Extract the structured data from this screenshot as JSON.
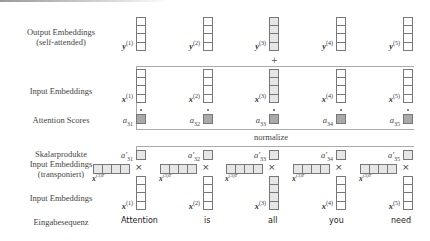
{
  "row_labels": {
    "output": "Output Embeddings",
    "output_sub": "(self-attended)",
    "input_top": "Input Embeddings",
    "scores": "Attention Scores",
    "dot_products": "Skalarprodukte",
    "input_transposed": "Input Embeddings",
    "input_transposed_sub": "(transponiert)",
    "input_bottom": "Input Embeddings",
    "sequence": "Eingabesequenz"
  },
  "normalize_label": "normalize",
  "plus_symbol": "+",
  "times_symbol": "×",
  "columns": [
    {
      "word": "Attention",
      "y": "y",
      "y_idx": "(1)",
      "x": "x",
      "x_idx": "(1)",
      "score": "a",
      "score_idx": "31",
      "score_norm": "a′",
      "score_norm_idx": "31",
      "xt": "x",
      "xt_idx": "(3)T",
      "highlight": false
    },
    {
      "word": "is",
      "y": "y",
      "y_idx": "(2)",
      "x": "x",
      "x_idx": "(2)",
      "score": "a",
      "score_idx": "32",
      "score_norm": "a′",
      "score_norm_idx": "32",
      "xt": "x",
      "xt_idx": "(3)T",
      "highlight": false
    },
    {
      "word": "all",
      "y": "y",
      "y_idx": "(3)",
      "x": "x",
      "x_idx": "(3)",
      "score": "a",
      "score_idx": "33",
      "score_norm": "a′",
      "score_norm_idx": "33",
      "xt": "x",
      "xt_idx": "(3)T",
      "highlight": true
    },
    {
      "word": "you",
      "y": "y",
      "y_idx": "(4)",
      "x": "x",
      "x_idx": "(4)",
      "score": "a",
      "score_idx": "34",
      "score_norm": "a′",
      "score_norm_idx": "34",
      "xt": "x",
      "xt_idx": "(3)T",
      "highlight": false
    },
    {
      "word": "need",
      "y": "y",
      "y_idx": "(5)",
      "x": "x",
      "x_idx": "(5)",
      "score": "a",
      "score_idx": "35",
      "score_norm": "a′",
      "score_norm_idx": "35",
      "xt": "x",
      "xt_idx": "(3)T",
      "highlight": false
    }
  ],
  "colors": {
    "cell_border": "#777777",
    "highlight_fill": "#e6e6e6",
    "score_fill": "#a9a9a9",
    "line": "#aaaaaa"
  }
}
